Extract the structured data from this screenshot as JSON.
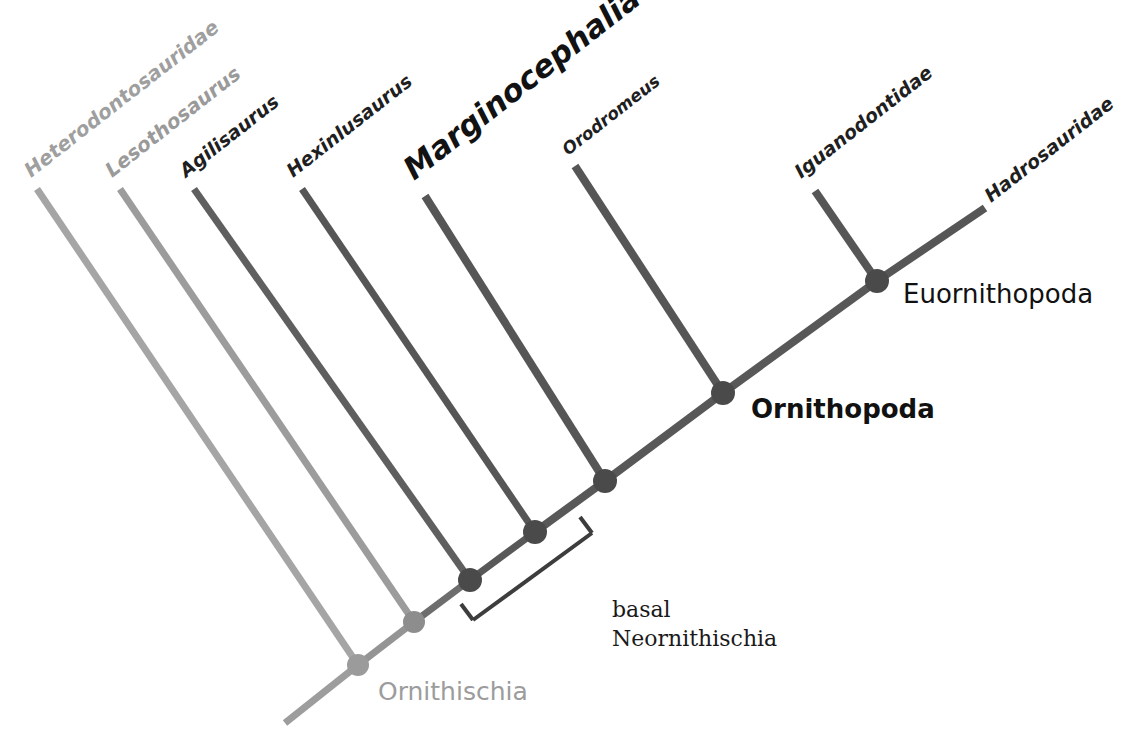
{
  "diagram": {
    "kind": "cladogram",
    "background_color": "#ffffff"
  },
  "colors": {
    "pale_gray": "#a5a5a5",
    "mid_gray": "#8f8f8f",
    "dark_gray": "#5a5a5a",
    "darker_gray": "#4c4c4c",
    "node_dark": "#4a4a4a",
    "node_mid": "#777777",
    "node_pale": "#9b9b9b",
    "text_black": "#1a1a1a",
    "text_gray": "#9a9a9a",
    "bracket": "#3d3d3d"
  },
  "tips": [
    {
      "id": "heterodontosauridae",
      "label": "Heterodontosauridae",
      "color": "#a5a5a5",
      "text_color": "#9f9f9f",
      "font_size": 20,
      "italic": true,
      "bold": false,
      "rotation": -38,
      "label_x": 31,
      "label_y": 178,
      "tip_x": 37,
      "tip_y": 189,
      "width": 6
    },
    {
      "id": "lesothosaurus",
      "label": "Lesothosaurus",
      "color": "#9c9c9c",
      "text_color": "#9a9a9a",
      "font_size": 20,
      "italic": true,
      "bold": false,
      "rotation": -38,
      "label_x": 112,
      "label_y": 178,
      "tip_x": 120,
      "tip_y": 189,
      "width": 6
    },
    {
      "id": "agilisaurus",
      "label": "Agilisaurus",
      "color": "#5f5f5f",
      "text_color": "#1f1f1f",
      "font_size": 19,
      "italic": true,
      "bold": false,
      "rotation": -38,
      "label_x": 186,
      "label_y": 178,
      "tip_x": 194,
      "tip_y": 189,
      "width": 6
    },
    {
      "id": "hexinlusaurus",
      "label": "Hexinlusaurus",
      "color": "#565656",
      "text_color": "#1f1f1f",
      "font_size": 19,
      "italic": true,
      "bold": false,
      "rotation": -38,
      "label_x": 293,
      "label_y": 178,
      "tip_x": 302,
      "tip_y": 189,
      "width": 6
    },
    {
      "id": "marginocephalia",
      "label": "Marginocephalia",
      "color": "#565656",
      "text_color": "#121212",
      "font_size": 31,
      "italic": false,
      "bold": false,
      "rotation": -38,
      "label_x": 414,
      "label_y": 181,
      "tip_x": 425,
      "tip_y": 196,
      "width": 7
    },
    {
      "id": "orodromeus",
      "label": "Orodromeus",
      "color": "#565656",
      "text_color": "#1f1f1f",
      "font_size": 17,
      "italic": true,
      "bold": false,
      "rotation": -38,
      "label_x": 568,
      "label_y": 156,
      "tip_x": 575,
      "tip_y": 166,
      "width": 7
    },
    {
      "id": "iguanodontidae",
      "label": "Iguanodontidae",
      "color": "#565656",
      "text_color": "#1f1f1f",
      "font_size": 19,
      "italic": false,
      "bold": false,
      "rotation": -38,
      "label_x": 801,
      "label_y": 179,
      "tip_x": 815,
      "tip_y": 191,
      "width": 7
    },
    {
      "id": "hadrosauridae",
      "label": "Hadrosauridae",
      "color": "#565656",
      "text_color": "#1f1f1f",
      "font_size": 19,
      "italic": false,
      "bold": false,
      "rotation": -38,
      "label_x": 991,
      "label_y": 203,
      "tip_x": 985,
      "tip_y": 208,
      "width": 7
    }
  ],
  "nodes": [
    {
      "id": "ornithischia",
      "label": "Ornithischia",
      "x": 358,
      "y": 665,
      "r": 11,
      "color": "#9b9b9b",
      "text_color": "#9c9c9c",
      "font_size": 25,
      "bold": false,
      "label_x": 378,
      "label_y": 700
    },
    {
      "id": "node-lesothosaurus",
      "label": "",
      "x": 414,
      "y": 622,
      "r": 11,
      "color": "#8d8d8d",
      "text_color": "#9c9c9c",
      "font_size": 0,
      "bold": false,
      "label_x": 0,
      "label_y": 0
    },
    {
      "id": "node-agilisaurus",
      "label": "",
      "x": 470,
      "y": 580,
      "r": 12,
      "color": "#4a4a4a",
      "text_color": "#1a1a1a",
      "font_size": 0,
      "bold": false,
      "label_x": 0,
      "label_y": 0
    },
    {
      "id": "node-hexinlusaurus",
      "label": "",
      "x": 535,
      "y": 532,
      "r": 12,
      "color": "#4a4a4a",
      "text_color": "#1a1a1a",
      "font_size": 0,
      "bold": false,
      "label_x": 0,
      "label_y": 0
    },
    {
      "id": "node-marginocephalia",
      "label": "",
      "x": 605,
      "y": 481,
      "r": 12,
      "color": "#4a4a4a",
      "text_color": "#1a1a1a",
      "font_size": 0,
      "bold": false,
      "label_x": 0,
      "label_y": 0
    },
    {
      "id": "ornithopoda",
      "label": "Ornithopoda",
      "x": 723,
      "y": 393,
      "r": 12,
      "color": "#4a4a4a",
      "text_color": "#111111",
      "font_size": 26,
      "bold": true,
      "label_x": 751,
      "label_y": 418
    },
    {
      "id": "euornithopoda",
      "label": "Euornithopoda",
      "x": 877,
      "y": 281,
      "r": 12,
      "color": "#4a4a4a",
      "text_color": "#111111",
      "font_size": 26,
      "bold": false,
      "label_x": 903,
      "label_y": 303
    }
  ],
  "branches": [
    {
      "id": "branch-root-tail",
      "from": [
        285,
        723
      ],
      "to": [
        358,
        665
      ],
      "color": "#9d9d9d",
      "width": 7
    },
    {
      "id": "branch-heterodontosauridae",
      "from": [
        37,
        189
      ],
      "to": [
        358,
        665
      ],
      "color": "#a5a5a5",
      "width": 7
    },
    {
      "id": "branch-backbone-1",
      "from": [
        358,
        665
      ],
      "to": [
        414,
        622
      ],
      "color": "#949494",
      "width": 7
    },
    {
      "id": "branch-lesothosaurus",
      "from": [
        120,
        189
      ],
      "to": [
        414,
        622
      ],
      "color": "#9c9c9c",
      "width": 7
    },
    {
      "id": "branch-backbone-2",
      "from": [
        414,
        622
      ],
      "to": [
        470,
        580
      ],
      "color": "#6d6d6d",
      "width": 7
    },
    {
      "id": "branch-agilisaurus",
      "from": [
        194,
        189
      ],
      "to": [
        470,
        580
      ],
      "color": "#5f5f5f",
      "width": 7
    },
    {
      "id": "branch-backbone-3",
      "from": [
        470,
        580
      ],
      "to": [
        535,
        532
      ],
      "color": "#585858",
      "width": 7
    },
    {
      "id": "branch-hexinlusaurus",
      "from": [
        302,
        189
      ],
      "to": [
        535,
        532
      ],
      "color": "#565656",
      "width": 7
    },
    {
      "id": "branch-backbone-4",
      "from": [
        535,
        532
      ],
      "to": [
        605,
        481
      ],
      "color": "#585858",
      "width": 8
    },
    {
      "id": "branch-marginocephalia",
      "from": [
        425,
        196
      ],
      "to": [
        605,
        481
      ],
      "color": "#565656",
      "width": 8
    },
    {
      "id": "branch-backbone-5",
      "from": [
        605,
        481
      ],
      "to": [
        723,
        393
      ],
      "color": "#585858",
      "width": 8
    },
    {
      "id": "branch-orodromeus",
      "from": [
        575,
        166
      ],
      "to": [
        723,
        393
      ],
      "color": "#565656",
      "width": 8
    },
    {
      "id": "branch-backbone-6",
      "from": [
        723,
        393
      ],
      "to": [
        877,
        281
      ],
      "color": "#585858",
      "width": 8
    },
    {
      "id": "branch-iguanodontidae",
      "from": [
        815,
        191
      ],
      "to": [
        877,
        281
      ],
      "color": "#565656",
      "width": 8
    },
    {
      "id": "branch-hadrosauridae",
      "from": [
        877,
        281
      ],
      "to": [
        985,
        208
      ],
      "color": "#565656",
      "width": 8
    }
  ],
  "bracket": {
    "id": "basal-neornithischia-bracket",
    "line_from": [
      473,
      620
    ],
    "line_to": [
      592,
      533
    ],
    "tick_a_from": [
      473,
      620
    ],
    "tick_a_to": [
      461,
      604
    ],
    "tick_b_from": [
      592,
      533
    ],
    "tick_b_to": [
      580,
      517
    ],
    "color": "#3d3d3d",
    "width": 4,
    "label_line_1": "basal",
    "label_line_2": "Neornithischia",
    "label_x": 612,
    "label_y": 617,
    "font_size": 22,
    "text_color": "#1a1a1a",
    "line_height": 29
  }
}
